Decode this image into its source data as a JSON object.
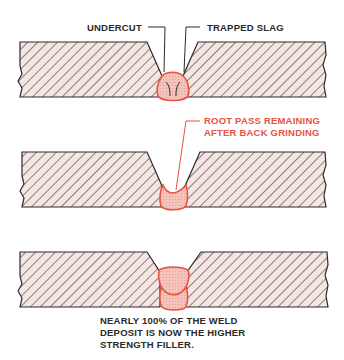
{
  "figure": {
    "colors": {
      "outline": "#2a2a2a",
      "hatch_fill": "#f6e6e3",
      "weld_fill": "#f4c4bc",
      "weld_outline": "#e8523f",
      "red_text": "#e8523f",
      "text": "#2a2a2a"
    },
    "panels": [
      {
        "id": "panel-1",
        "labels": {
          "undercut": "UNDERCUT",
          "trapped_slag": "TRAPPED SLAG"
        }
      },
      {
        "id": "panel-2",
        "labels": {
          "root_pass_line1": "ROOT PASS REMAINING",
          "root_pass_line2": "AFTER BACK GRINDING"
        }
      },
      {
        "id": "panel-3",
        "caption": {
          "line1": "NEARLY 100% OF THE WELD",
          "line2": "DEPOSIT IS NOW THE HIGHER",
          "line3": "STRENGTH FILLER."
        }
      }
    ]
  }
}
